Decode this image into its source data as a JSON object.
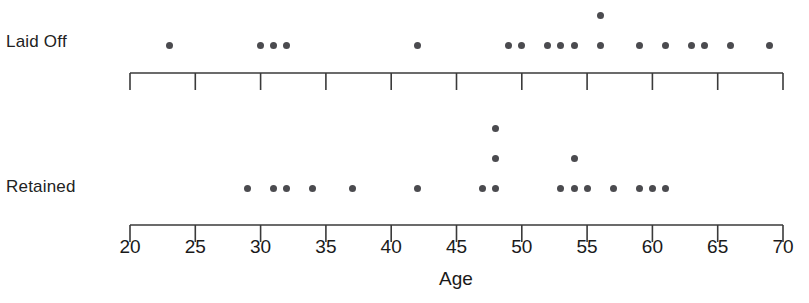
{
  "chart_data": {
    "type": "scatter",
    "title": "",
    "xlabel": "Age",
    "ylabel": "",
    "xlim": [
      20,
      70
    ],
    "grid": false,
    "legend_position": "none",
    "plot_style": "dot-plot",
    "x_ticks": [
      20,
      25,
      30,
      35,
      40,
      45,
      50,
      55,
      60,
      65,
      70
    ],
    "x_tick_labels": [
      "20",
      "25",
      "30",
      "35",
      "40",
      "45",
      "50",
      "55",
      "60",
      "65",
      "70"
    ],
    "x_tick_step": 5,
    "dot_color": "#4b4b4f",
    "axis_color": "#3a3a3a",
    "background_color": "#ffffff",
    "groups": [
      {
        "name": "laid-off",
        "label": "Laid Off",
        "count": 22,
        "values": [
          23,
          30,
          31,
          32,
          42,
          49,
          50,
          52,
          53,
          54,
          56,
          56,
          59,
          61,
          63,
          64,
          66,
          69
        ],
        "stacks": [
          {
            "age": 23,
            "count": 1
          },
          {
            "age": 30,
            "count": 1
          },
          {
            "age": 31,
            "count": 1
          },
          {
            "age": 32,
            "count": 1
          },
          {
            "age": 42,
            "count": 1
          },
          {
            "age": 49,
            "count": 1
          },
          {
            "age": 50,
            "count": 1
          },
          {
            "age": 52,
            "count": 1
          },
          {
            "age": 53,
            "count": 1
          },
          {
            "age": 54,
            "count": 1
          },
          {
            "age": 56,
            "count": 2
          },
          {
            "age": 59,
            "count": 1
          },
          {
            "age": 61,
            "count": 1
          },
          {
            "age": 63,
            "count": 1
          },
          {
            "age": 64,
            "count": 1
          },
          {
            "age": 66,
            "count": 1
          },
          {
            "age": 69,
            "count": 1
          }
        ]
      },
      {
        "name": "retained",
        "label": "Retained",
        "count": 19,
        "values": [
          29,
          31,
          32,
          34,
          37,
          42,
          47,
          48,
          48,
          48,
          53,
          54,
          54,
          55,
          57,
          59,
          60,
          61
        ],
        "stacks": [
          {
            "age": 29,
            "count": 1
          },
          {
            "age": 31,
            "count": 1
          },
          {
            "age": 32,
            "count": 1
          },
          {
            "age": 34,
            "count": 1
          },
          {
            "age": 37,
            "count": 1
          },
          {
            "age": 42,
            "count": 1
          },
          {
            "age": 47,
            "count": 1
          },
          {
            "age": 48,
            "count": 3
          },
          {
            "age": 53,
            "count": 1
          },
          {
            "age": 54,
            "count": 2
          },
          {
            "age": 55,
            "count": 1
          },
          {
            "age": 57,
            "count": 1
          },
          {
            "age": 59,
            "count": 1
          },
          {
            "age": 60,
            "count": 1
          },
          {
            "age": 61,
            "count": 1
          }
        ]
      }
    ]
  },
  "layout": {
    "axis_left_px": 130,
    "axis_right_px": 783,
    "px_per_year": 13.06,
    "laid_off_baseline_y": 45,
    "retained_baseline_y": 188,
    "stack_step_y": 30,
    "top_axis_y": 73,
    "bottom_axis_y": 225,
    "tick_length": 17,
    "tick_label_y": 236
  }
}
